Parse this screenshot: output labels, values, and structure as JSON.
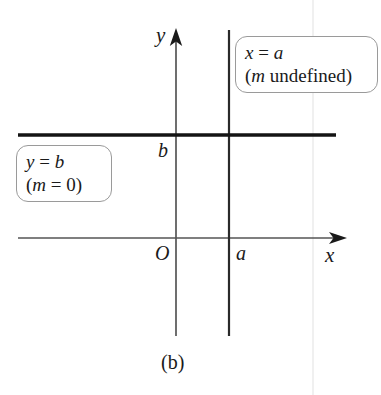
{
  "figure": {
    "caption": "(b)",
    "background_color": "#ffffff",
    "ink_color": "#1a1a1a"
  },
  "axes": {
    "x_label": "x",
    "y_label": "y",
    "origin_label": "O",
    "x_axis_y": 238,
    "y_axis_x": 176,
    "x_arrow_tip_x": 345,
    "y_arrow_tip_y": 30
  },
  "ticks": {
    "x_tick_label": "a",
    "y_tick_label": "b"
  },
  "lines": [
    {
      "id": "vertical-line",
      "equation": "x = a",
      "slope_note": "(m undefined)",
      "orientation": "vertical",
      "x_pixel": 229,
      "y_start": 30,
      "y_end": 336,
      "stroke_width": 2.2
    },
    {
      "id": "horizontal-line",
      "equation": "y = b",
      "slope_note": "(m = 0)",
      "orientation": "horizontal",
      "y_pixel": 135,
      "x_start": 18,
      "x_end": 336,
      "stroke_width": 3.4
    }
  ],
  "callouts": {
    "vertical": {
      "name": "x-equals-a-callout",
      "line1_var": "x",
      "line1_rel": " = ",
      "line1_val": "a",
      "line2_open": "(",
      "line2_var": "m",
      "line2_text": " undefined)"
    },
    "horizontal": {
      "name": "y-equals-b-callout",
      "line1_var": "y",
      "line1_rel": " = ",
      "line1_val": "b",
      "line2_open": "(",
      "line2_var": "m",
      "line2_text": " = 0)"
    }
  },
  "artifact": {
    "scan_line_x": 313,
    "color": "#ededed"
  }
}
